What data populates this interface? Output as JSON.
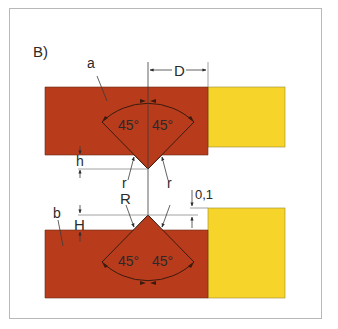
{
  "figure": {
    "panel_label": "B)",
    "colors": {
      "frame": "#b8b8b8",
      "red_part": "#b83c1c",
      "yellow_part": "#f7d42a",
      "line": "#3a3a3a",
      "dim_line": "#8a8a8a"
    },
    "parts": {
      "top": {
        "label": "a",
        "angle_left": "45°",
        "angle_right": "45°",
        "radius_label": "r"
      },
      "bottom": {
        "label": "b",
        "angle_left": "45°",
        "angle_right": "45°",
        "radius_label": "R"
      }
    },
    "dimensions": {
      "D": "D",
      "h": "h",
      "H": "H",
      "offset": "0,1",
      "r_left": "r",
      "r_right": "r"
    }
  }
}
